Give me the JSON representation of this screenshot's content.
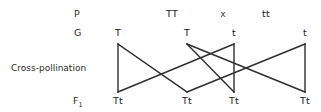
{
  "figure": {
    "type": "punnett-cross-diagram",
    "title_present": false,
    "line_color": "#2e2e2e",
    "text_color": "#1c1c1c",
    "background": "#ffffff"
  },
  "row_labels": {
    "parental": "P",
    "gametes": "G",
    "process": "Cross-pollination",
    "offspring_prefix": "F",
    "offspring_subscript": "1"
  },
  "parental_generation": {
    "left_genotype": "TT",
    "cross_symbol": "x",
    "right_genotype": "tt"
  },
  "gametes": [
    {
      "label": "T",
      "x": 118
    },
    {
      "label": "T",
      "x": 187
    },
    {
      "label": "t",
      "x": 234
    },
    {
      "label": "t",
      "x": 305
    }
  ],
  "offspring": [
    {
      "label": "Tt",
      "x": 118
    },
    {
      "label": "Tt",
      "x": 187
    },
    {
      "label": "Tt",
      "x": 234
    },
    {
      "label": "Tt",
      "x": 305
    }
  ],
  "connections": [
    {
      "from_gamete": 0,
      "to_offspring": 0
    },
    {
      "from_gamete": 0,
      "to_offspring": 1
    },
    {
      "from_gamete": 1,
      "to_offspring": 2
    },
    {
      "from_gamete": 1,
      "to_offspring": 3
    },
    {
      "from_gamete": 2,
      "to_offspring": 0
    },
    {
      "from_gamete": 2,
      "to_offspring": 2
    },
    {
      "from_gamete": 3,
      "to_offspring": 1
    },
    {
      "from_gamete": 3,
      "to_offspring": 3
    }
  ],
  "geometry": {
    "gamete_y": 44,
    "offspring_y": 92
  }
}
